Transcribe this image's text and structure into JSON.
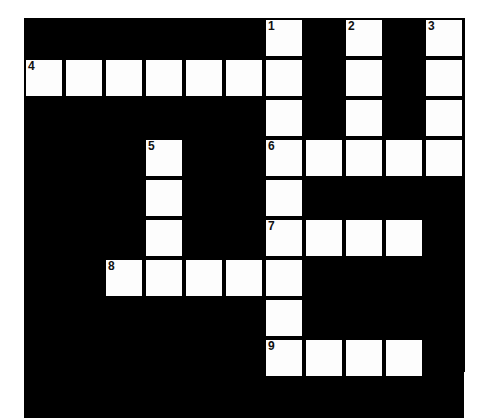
{
  "puzzle": {
    "type": "crossword-grid",
    "title": "",
    "rows": 10,
    "cols": 11,
    "cell_size": 40,
    "origin": {
      "x": 24,
      "y": 18
    },
    "colors": {
      "block": "#000000",
      "open": "#fdfdfd",
      "border": "#000000",
      "number": "#111111",
      "page_background": "#ffffff"
    },
    "numbered_cells": [
      {
        "number": "1",
        "row": 0,
        "col": 6
      },
      {
        "number": "2",
        "row": 0,
        "col": 8
      },
      {
        "number": "3",
        "row": 0,
        "col": 10
      },
      {
        "number": "4",
        "row": 1,
        "col": 0
      },
      {
        "number": "5",
        "row": 3,
        "col": 3
      },
      {
        "number": "6",
        "row": 3,
        "col": 6
      },
      {
        "number": "7",
        "row": 5,
        "col": 6
      },
      {
        "number": "8",
        "row": 6,
        "col": 2
      },
      {
        "number": "9",
        "row": 8,
        "col": 6
      }
    ],
    "entries": {
      "across": [
        {
          "number": "4",
          "row": 1,
          "col": 0,
          "length": 7
        },
        {
          "number": "6",
          "row": 3,
          "col": 6,
          "length": 5
        },
        {
          "number": "7",
          "row": 5,
          "col": 6,
          "length": 4
        },
        {
          "number": "8",
          "row": 6,
          "col": 2,
          "length": 5
        },
        {
          "number": "9",
          "row": 8,
          "col": 6,
          "length": 4
        }
      ],
      "down": [
        {
          "number": "1",
          "row": 0,
          "col": 6,
          "length": 9
        },
        {
          "number": "2",
          "row": 0,
          "col": 8,
          "length": 4
        },
        {
          "number": "3",
          "row": 0,
          "col": 10,
          "length": 4
        },
        {
          "number": "5",
          "row": 3,
          "col": 3,
          "length": 4
        }
      ]
    },
    "open_cells": [
      [
        0,
        6
      ],
      [
        0,
        8
      ],
      [
        0,
        10
      ],
      [
        1,
        0
      ],
      [
        1,
        1
      ],
      [
        1,
        2
      ],
      [
        1,
        3
      ],
      [
        1,
        4
      ],
      [
        1,
        5
      ],
      [
        1,
        6
      ],
      [
        1,
        8
      ],
      [
        1,
        10
      ],
      [
        2,
        6
      ],
      [
        2,
        8
      ],
      [
        2,
        10
      ],
      [
        3,
        3
      ],
      [
        3,
        6
      ],
      [
        3,
        7
      ],
      [
        3,
        8
      ],
      [
        3,
        9
      ],
      [
        3,
        10
      ],
      [
        4,
        3
      ],
      [
        4,
        6
      ],
      [
        5,
        3
      ],
      [
        5,
        6
      ],
      [
        5,
        7
      ],
      [
        5,
        8
      ],
      [
        5,
        9
      ],
      [
        6,
        2
      ],
      [
        6,
        3
      ],
      [
        6,
        4
      ],
      [
        6,
        5
      ],
      [
        6,
        6
      ],
      [
        7,
        6
      ],
      [
        8,
        6
      ],
      [
        8,
        7
      ],
      [
        8,
        8
      ],
      [
        8,
        9
      ]
    ]
  }
}
